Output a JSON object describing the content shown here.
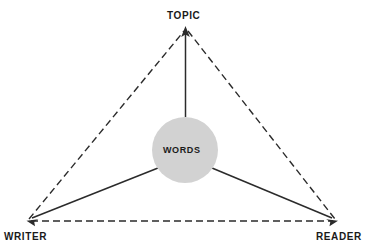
{
  "diagram": {
    "canvas": {
      "width": 373,
      "height": 249,
      "background": "#ffffff"
    },
    "colors": {
      "line": "#2b2b2b",
      "dashed_line": "#2b2b2b",
      "circle_fill": "#d2d2d2",
      "text": "#1a1a1a",
      "background": "#ffffff"
    },
    "vertices": [
      {
        "id": "topic",
        "label": "TOPIC",
        "x": 186,
        "y": 28
      },
      {
        "id": "writer",
        "label": "WRITER",
        "x": 27,
        "y": 221
      },
      {
        "id": "reader",
        "label": "READER",
        "x": 337,
        "y": 221
      }
    ],
    "center_node": {
      "id": "words",
      "label": "WORDS",
      "cx": 185,
      "cy": 150,
      "r": 33,
      "fill": "#d2d2d2"
    },
    "dashed_edges": [
      {
        "id": "writer-topic",
        "from": "writer",
        "to": "topic"
      },
      {
        "id": "topic-reader",
        "from": "topic",
        "to": "reader"
      },
      {
        "id": "writer-reader",
        "from": "writer",
        "to": "reader"
      }
    ],
    "solid_arrows": [
      {
        "id": "words-to-topic",
        "from": "words",
        "to": "topic",
        "arrowhead": true
      },
      {
        "id": "words-to-writer",
        "from": "words",
        "to": "writer",
        "arrowhead": true
      },
      {
        "id": "words-to-reader",
        "from": "words",
        "to": "reader",
        "arrowhead": true
      }
    ],
    "dash_pattern": "7 4",
    "stroke_width": 1.4
  }
}
